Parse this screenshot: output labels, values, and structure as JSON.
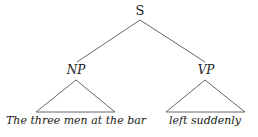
{
  "tree": {
    "root": {
      "label": "S"
    },
    "children": [
      {
        "label": "NP",
        "leaf": "The three men at the bar"
      },
      {
        "label": "VP",
        "leaf": "left suddenly"
      }
    ]
  },
  "colors": {
    "line": "#555555",
    "text": "#1a1a1a",
    "background": "#ffffff"
  }
}
